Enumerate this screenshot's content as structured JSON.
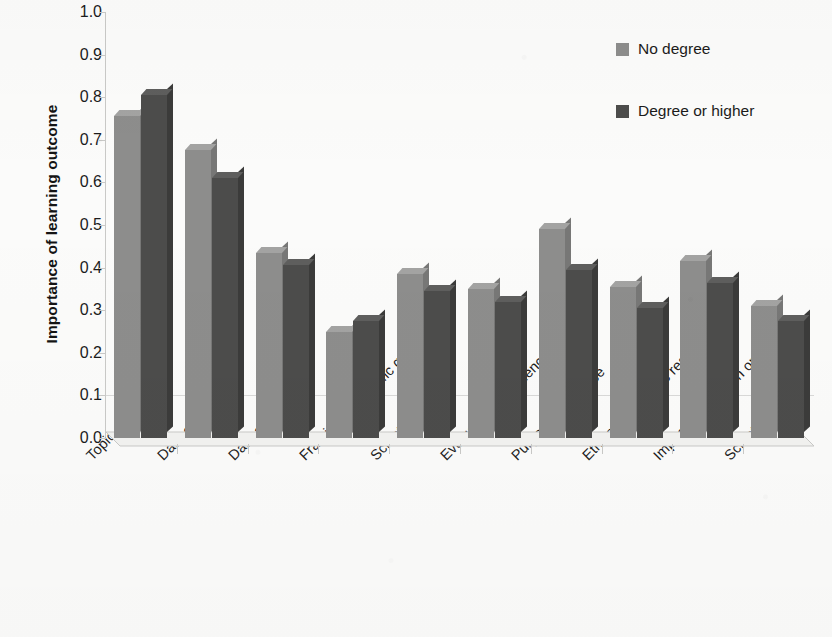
{
  "chart_data": {
    "type": "bar",
    "title": "",
    "xlabel": "",
    "ylabel": "Importance of learning outcome",
    "ylim": [
      0.0,
      1.0
    ],
    "ytick_labels": [
      "1.0",
      "0.9",
      "0.8",
      "0.7",
      "0.6",
      "0.5",
      "0.4",
      "0.3",
      "0.2",
      "0.1",
      "0.0"
    ],
    "ytick_values": [
      1.0,
      0.9,
      0.8,
      0.7,
      0.6,
      0.5,
      0.4,
      0.3,
      0.2,
      0.1,
      0.0
    ],
    "grid": false,
    "legend_position": "top-right",
    "categories": [
      "Topic of project",
      "Data collection",
      "Data analysis",
      "Framing a scientific question",
      "Scientific method",
      "Evaluation of evidence",
      "Purpose of science",
      "Ethics of scientific research",
      "Impact of research on others",
      "Scientific careers"
    ],
    "series": [
      {
        "name": "No degree",
        "color": "#8d8d8c",
        "values": [
          0.755,
          0.675,
          0.435,
          0.25,
          0.385,
          0.35,
          0.49,
          0.355,
          0.415,
          0.31
        ]
      },
      {
        "name": "Degree or higher",
        "color": "#4c4c4b",
        "values": [
          0.805,
          0.61,
          0.405,
          0.275,
          0.345,
          0.32,
          0.395,
          0.305,
          0.365,
          0.275
        ]
      }
    ]
  },
  "legend": {
    "items": [
      {
        "label": "No degree",
        "swatch": "light"
      },
      {
        "label": "Degree or higher",
        "swatch": "dark"
      }
    ]
  }
}
